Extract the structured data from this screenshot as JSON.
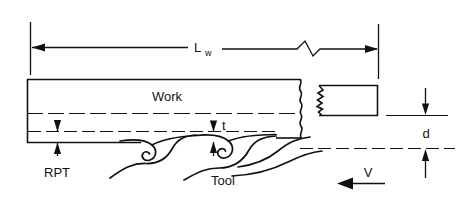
{
  "figure": {
    "type": "engineering-diagram",
    "background_color": "#ffffff",
    "line_color": "#111111"
  },
  "labels": {
    "work": "Work",
    "tool": "Tool",
    "rpt": "RPT",
    "length": "L",
    "length_sub": "w",
    "thickness": "t",
    "depth": "d",
    "velocity": "V"
  },
  "dimensions": [
    {
      "name": "L_w",
      "label": "L",
      "subscript": "w",
      "orientation": "horizontal",
      "position": "top",
      "has_break_symbol": true,
      "arrowheads": "both"
    },
    {
      "name": "RPT",
      "label": "RPT",
      "orientation": "vertical",
      "position": "lower-left",
      "arrowheads": "both"
    },
    {
      "name": "t",
      "label": "t",
      "orientation": "vertical",
      "position": "center",
      "arrowheads": "both"
    },
    {
      "name": "d",
      "label": "d",
      "orientation": "vertical",
      "position": "right",
      "arrowheads": "both"
    }
  ],
  "annotations": {
    "velocity_arrow_direction": "left",
    "chip_curl_count": 2,
    "break_lines": "wavy",
    "centerline_style": "dash-dot"
  }
}
